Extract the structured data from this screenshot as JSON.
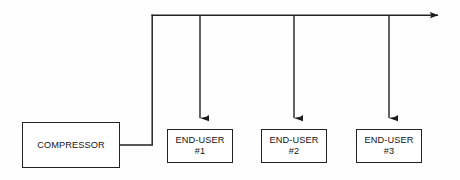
{
  "diagram": {
    "background_color": "#fefefe",
    "line_color": "#222222",
    "text_color": "#141414",
    "nodes": [
      {
        "id": "compressor",
        "label": "COMPRESSOR",
        "lines": [
          "COMPRESSOR"
        ],
        "x": 22,
        "y": 122,
        "width": 98,
        "height": 46
      },
      {
        "id": "enduser-1",
        "label": "END-USER #1",
        "lines": [
          "END-USER",
          "#1"
        ],
        "x": 167,
        "y": 129,
        "width": 66,
        "height": 34
      },
      {
        "id": "enduser-2",
        "label": "END-USER #2",
        "lines": [
          "END-USER",
          "#2"
        ],
        "x": 261,
        "y": 129,
        "width": 66,
        "height": 34
      },
      {
        "id": "enduser-3",
        "label": "END-USER #3",
        "lines": [
          "END-USER",
          "#3"
        ],
        "x": 356,
        "y": 129,
        "width": 66,
        "height": 34
      }
    ],
    "connectors": [
      {
        "id": "compressor-riser",
        "name": "compressor-discharge-line",
        "description": "Line from compressor right edge running right then up to the main header",
        "arrowhead": false
      },
      {
        "id": "main-header",
        "name": "main-header-pipe",
        "description": "Horizontal header running left to right across the top, terminating in an arrowhead",
        "arrowhead": true
      },
      {
        "id": "branch-1",
        "name": "branch-drop-to-enduser-1",
        "description": "Vertical branch dropping from header into END-USER #1",
        "arrowhead": true
      },
      {
        "id": "branch-2",
        "name": "branch-drop-to-enduser-2",
        "description": "Vertical branch dropping from header into END-USER #2",
        "arrowhead": true
      },
      {
        "id": "branch-3",
        "name": "branch-drop-to-enduser-3",
        "description": "Vertical branch dropping from header into END-USER #3",
        "arrowhead": true
      }
    ]
  }
}
